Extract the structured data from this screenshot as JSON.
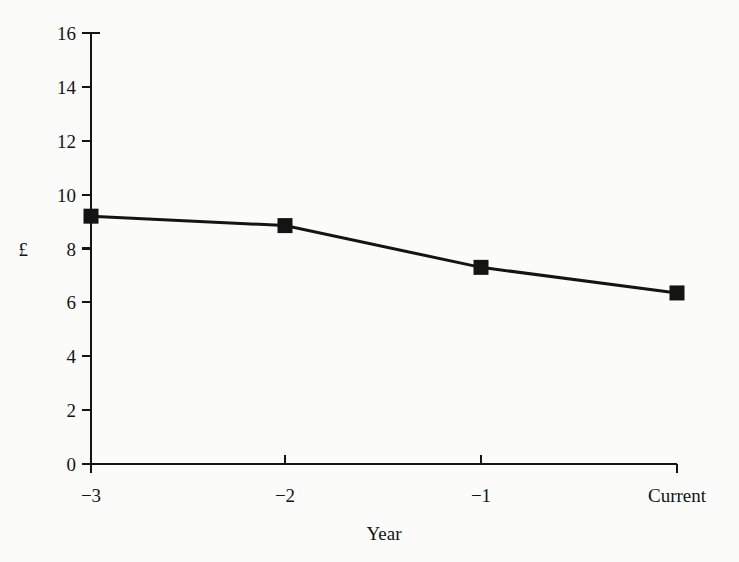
{
  "chart_data": {
    "type": "line",
    "title": "",
    "xlabel": "Year",
    "ylabel": "£",
    "categories": [
      "-3",
      "-2",
      "-1",
      "Current"
    ],
    "x": [
      0,
      1,
      2,
      3
    ],
    "values": [
      9.2,
      8.85,
      7.3,
      6.35
    ],
    "series": [
      {
        "name": "",
        "values": [
          9.2,
          8.85,
          7.3,
          6.35
        ]
      }
    ],
    "ylim": [
      0,
      16
    ],
    "ytick_step": 2,
    "yticks": [
      "0",
      "2",
      "4",
      "6",
      "8",
      "10",
      "12",
      "14",
      "16"
    ],
    "xticks": [
      "-3",
      "-2",
      "-1",
      "Current"
    ],
    "grid": false,
    "legend": false,
    "legend_position": "none",
    "marker": "filled-square",
    "line_color": "#141414",
    "marker_color": "#141414",
    "background_color": "#fbfbfa"
  },
  "geometry": {
    "x_positions": [
      91,
      285,
      481,
      677
    ],
    "y_baseline": 464,
    "y_top": 33,
    "pixels_per_unit": 26.94
  }
}
